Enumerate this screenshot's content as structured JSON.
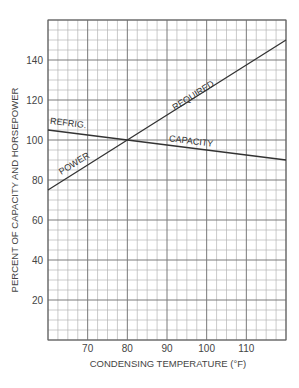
{
  "chart_data": {
    "type": "line",
    "title": "",
    "xlabel": "CONDENSING TEMPERATURE (°F)",
    "ylabel": "PERCENT OF CAPACITY AND HORSEPOWER",
    "xlim": [
      60,
      120
    ],
    "ylim": [
      0,
      160
    ],
    "x_ticks": [
      70,
      80,
      90,
      100,
      110
    ],
    "y_ticks": [
      20,
      40,
      60,
      80,
      100,
      120,
      140
    ],
    "grid": true,
    "grid_minor_x_step": 2.5,
    "grid_minor_y_step": 5,
    "grid_major_x_step": 10,
    "grid_major_y_step": 20,
    "legend": "none (inline line labels)",
    "series": [
      {
        "name": "POWER REQUIRED",
        "x": [
          60,
          80,
          120
        ],
        "values": [
          75,
          100,
          150
        ],
        "labels": [
          {
            "text": "POWER",
            "x": 67,
            "y": 87
          },
          {
            "text": "REQUIRED",
            "x": 97,
            "y": 121
          }
        ]
      },
      {
        "name": "REFRIG. CAPACITY",
        "x": [
          60,
          80,
          120
        ],
        "values": [
          105,
          100,
          90
        ],
        "labels": [
          {
            "text": "REFRIG.",
            "x": 65,
            "y": 107
          },
          {
            "text": "CAPACITY",
            "x": 96,
            "y": 98
          }
        ]
      }
    ],
    "colors": {
      "line": "#333333",
      "major_grid": "#7a7a7a",
      "minor_grid": "#b4b4b4",
      "text": "#444444"
    }
  }
}
